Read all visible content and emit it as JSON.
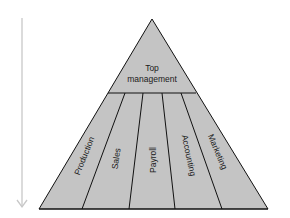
{
  "diagram": {
    "type": "pyramid",
    "colors": {
      "fill": "#c4c4c4",
      "stroke": "#111111",
      "arrow": "#c8c8c8"
    },
    "top": {
      "line1": "Top",
      "line2": "management"
    },
    "segments": [
      {
        "label": "Production"
      },
      {
        "label": "Sales"
      },
      {
        "label": "Payroll"
      },
      {
        "label": "Accounting"
      },
      {
        "label": "Marketing"
      }
    ],
    "arrow": {
      "direction": "down"
    }
  }
}
